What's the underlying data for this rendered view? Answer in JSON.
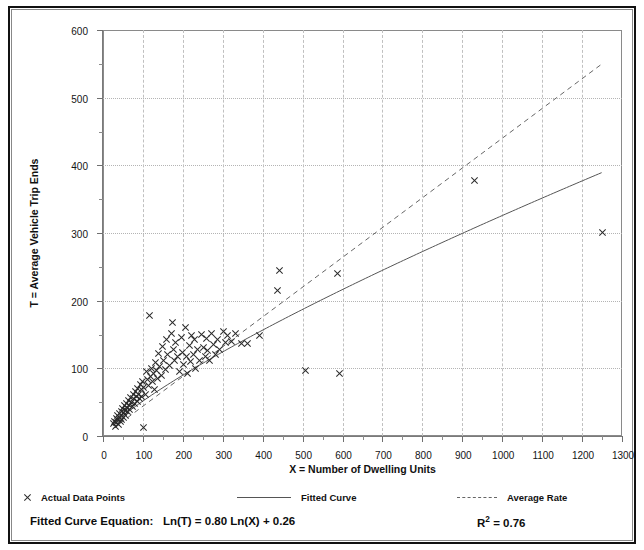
{
  "figure": {
    "title_fragment": "Plot",
    "background_color": "#ffffff",
    "frame_color": "#111111"
  },
  "axis_titles": {
    "y": "T = Average Vehicle Trip Ends",
    "x": "X = Number of Dwelling Units"
  },
  "legend": {
    "items": [
      {
        "label": "Actual Data Points",
        "marker": "x-marker-icon"
      },
      {
        "label": "Fitted Curve",
        "marker": "solid-line-icon"
      },
      {
        "label": "Average Rate",
        "marker": "dashed-line-icon"
      }
    ]
  },
  "footer": {
    "equation_label": "Fitted Curve Equation:",
    "equation": "Ln(T) = 0.80 Ln(X) + 0.26",
    "r_squared_label": "R",
    "r_squared_exp": "2",
    "r_squared_value": "= 0.76",
    "r_squared_full": "R² = 0.76"
  },
  "chart_data": {
    "type": "scatter",
    "title": "",
    "xlabel": "X = Number of Dwelling Units",
    "ylabel": "T = Average Vehicle Trip Ends",
    "xlim": [
      0,
      1300
    ],
    "ylim": [
      0,
      600
    ],
    "xticks": [
      0,
      100,
      200,
      300,
      400,
      500,
      600,
      700,
      800,
      900,
      1000,
      1100,
      1200,
      1300
    ],
    "yticks": [
      0,
      100,
      200,
      300,
      400,
      500,
      600
    ],
    "xtick_minor_step": 50,
    "ytick_minor_step": 50,
    "grid": true,
    "grid_style": {
      "horizontal": "dotted",
      "vertical": "dashed",
      "color": "#bbbbbb"
    },
    "legend_position": "below-plot",
    "marker": "x",
    "marker_color": "#2a2a2a",
    "series": [
      {
        "name": "Actual Data Points",
        "type": "scatter",
        "points": [
          [
            25,
            18
          ],
          [
            28,
            22
          ],
          [
            30,
            14
          ],
          [
            32,
            26
          ],
          [
            33,
            20
          ],
          [
            35,
            30
          ],
          [
            36,
            24
          ],
          [
            38,
            17
          ],
          [
            40,
            33
          ],
          [
            41,
            27
          ],
          [
            42,
            21
          ],
          [
            44,
            36
          ],
          [
            45,
            30
          ],
          [
            46,
            24
          ],
          [
            48,
            40
          ],
          [
            50,
            34
          ],
          [
            51,
            28
          ],
          [
            52,
            45
          ],
          [
            54,
            38
          ],
          [
            55,
            31
          ],
          [
            57,
            48
          ],
          [
            58,
            42
          ],
          [
            60,
            36
          ],
          [
            62,
            52
          ],
          [
            64,
            45
          ],
          [
            66,
            39
          ],
          [
            68,
            57
          ],
          [
            70,
            50
          ],
          [
            72,
            44
          ],
          [
            74,
            62
          ],
          [
            76,
            55
          ],
          [
            78,
            48
          ],
          [
            80,
            66
          ],
          [
            82,
            58
          ],
          [
            84,
            51
          ],
          [
            86,
            70
          ],
          [
            88,
            62
          ],
          [
            90,
            55
          ],
          [
            92,
            76
          ],
          [
            94,
            68
          ],
          [
            96,
            58
          ],
          [
            98,
            80
          ],
          [
            100,
            72
          ],
          [
            100,
            13
          ],
          [
            105,
            62
          ],
          [
            108,
            96
          ],
          [
            110,
            84
          ],
          [
            112,
            75
          ],
          [
            115,
            178
          ],
          [
            118,
            88
          ],
          [
            120,
            100
          ],
          [
            122,
            80
          ],
          [
            125,
            92
          ],
          [
            128,
            68
          ],
          [
            130,
            108
          ],
          [
            132,
            97
          ],
          [
            135,
            85
          ],
          [
            138,
            122
          ],
          [
            140,
            102
          ],
          [
            145,
            90
          ],
          [
            148,
            132
          ],
          [
            150,
            112
          ],
          [
            155,
            98
          ],
          [
            158,
            142
          ],
          [
            160,
            120
          ],
          [
            165,
            104
          ],
          [
            170,
            152
          ],
          [
            172,
            168
          ],
          [
            175,
            128
          ],
          [
            178,
            112
          ],
          [
            180,
            138
          ],
          [
            185,
            118
          ],
          [
            190,
            96
          ],
          [
            195,
            145
          ],
          [
            198,
            124
          ],
          [
            200,
            105
          ],
          [
            205,
            160
          ],
          [
            208,
            118
          ],
          [
            210,
            92
          ],
          [
            215,
            134
          ],
          [
            218,
            110
          ],
          [
            220,
            148
          ],
          [
            225,
            120
          ],
          [
            228,
            142
          ],
          [
            230,
            100
          ],
          [
            235,
            128
          ],
          [
            240,
            112
          ],
          [
            245,
            150
          ],
          [
            250,
            131
          ],
          [
            255,
            118
          ],
          [
            258,
            144
          ],
          [
            260,
            126
          ],
          [
            265,
            112
          ],
          [
            270,
            152
          ],
          [
            275,
            135
          ],
          [
            280,
            120
          ],
          [
            285,
            142
          ],
          [
            290,
            128
          ],
          [
            300,
            155
          ],
          [
            305,
            138
          ],
          [
            310,
            148
          ],
          [
            320,
            140
          ],
          [
            330,
            152
          ],
          [
            345,
            136
          ],
          [
            360,
            137
          ],
          [
            390,
            148
          ],
          [
            435,
            215
          ],
          [
            440,
            245
          ],
          [
            505,
            97
          ],
          [
            585,
            240
          ],
          [
            590,
            93
          ],
          [
            930,
            378
          ],
          [
            1250,
            301
          ]
        ]
      },
      {
        "name": "Fitted Curve",
        "type": "line",
        "style": "solid",
        "color": "#555555",
        "equation": "Ln(T) = 0.80 Ln(X) + 0.26",
        "r_squared": 0.76,
        "endpoints": [
          [
            25,
            20
          ],
          [
            1250,
            390
          ]
        ]
      },
      {
        "name": "Average Rate",
        "type": "line",
        "style": "dashed",
        "color": "#666666",
        "endpoints": [
          [
            25,
            11
          ],
          [
            1250,
            550
          ]
        ]
      }
    ]
  }
}
